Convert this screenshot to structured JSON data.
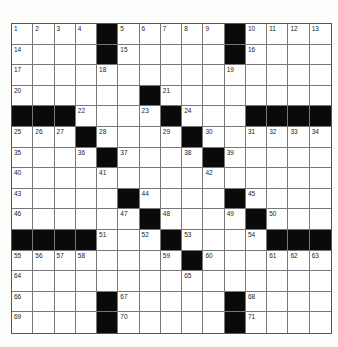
{
  "puzzle": {
    "rows": 15,
    "cols": 15,
    "colors": {
      "black": "#0a0a0a",
      "white": "#ffffff",
      "line": "#777777"
    },
    "layout": [
      "1 2 3 4 # 5 6 7 8 9 # 10 11 12 13",
      "14 . . . # 15 . . . . # 16 . . .",
      "17 . . . 18 . . . . . 19 . . . .",
      "20 . . . . . # 21 . . . . . . .",
      "# # # 22 . . 23 # 24 . . # # # #",
      "25 26 27 # 28 . . 29 # 30 . 31 32 33 34",
      "35 . . 36 # 37 . . 38 # 39 . . . .",
      "40 . . . 41 . . . . 42 . . . . .",
      "43 . . . . # 44 . . . # 45 . . .",
      "46 . . . . 47 # 48 . . 49 # 50 . .",
      "# # # # 51 . 52 # 53 . . 54 # # #",
      "55 56 57 58 . . . 59 # 60 . . 61 62 63",
      "64 . . . . . . . 65 . . . . . .",
      "66 . . . # 67 . . . . # 68 . . .",
      "69 . . . # 70 . . . . # 71 . . ."
    ]
  }
}
